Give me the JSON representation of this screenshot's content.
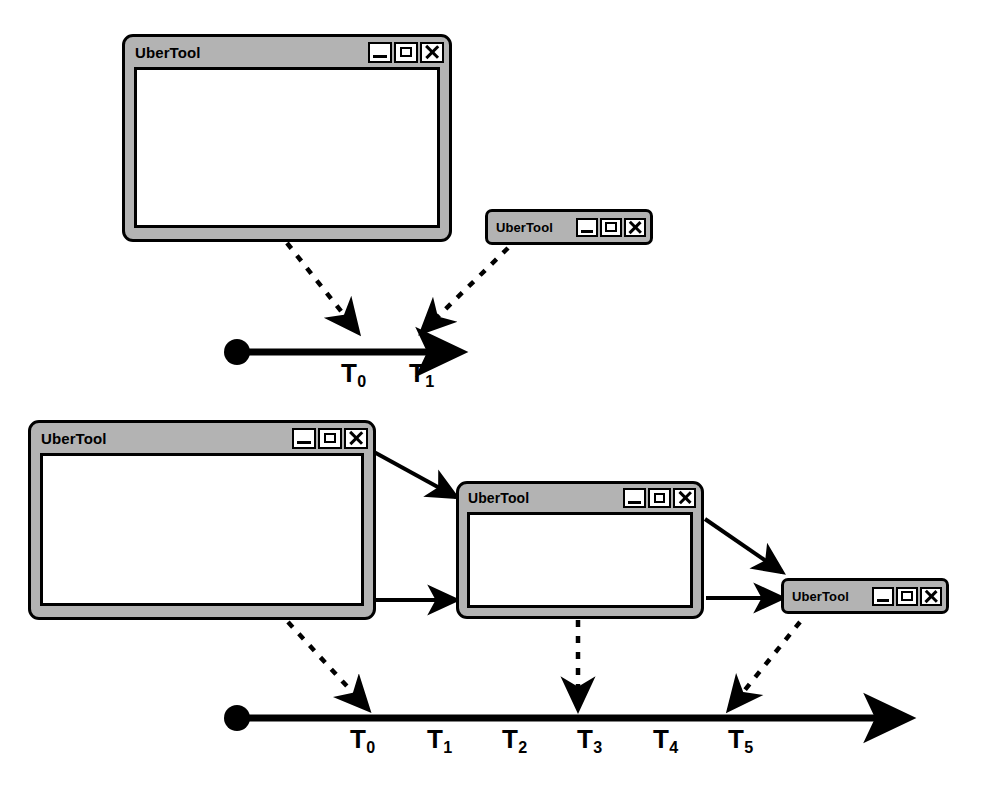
{
  "diagram": {
    "colors": {
      "window_frame": "#b3b3b3",
      "window_body": "#ffffff",
      "outline": "#000000",
      "background": "#ffffff"
    },
    "window_title": "UberTool",
    "window_buttons": [
      {
        "name": "minimize-button",
        "icon": "minimize-icon",
        "label": "_"
      },
      {
        "name": "maximize-button",
        "icon": "maximize-icon",
        "label": "□"
      },
      {
        "name": "close-button",
        "icon": "close-icon",
        "label": "✕"
      }
    ],
    "scenarios": [
      {
        "id": "scenario-1",
        "windows": [
          {
            "id": "s1-window-normal",
            "state": "normal",
            "title": "UberTool"
          },
          {
            "id": "s1-window-minimized",
            "state": "minimized",
            "title": "UberTool"
          }
        ],
        "timeline": {
          "id": "timeline-1",
          "ticks": [
            "T0",
            "T1"
          ],
          "tick_labels": [
            {
              "base": "T",
              "sub": "0"
            },
            {
              "base": "T",
              "sub": "1"
            }
          ]
        },
        "transitions": [
          {
            "from": "s1-window-normal",
            "to": "T0",
            "style": "dashed"
          },
          {
            "from": "s1-window-minimized",
            "to": "T1",
            "style": "dashed"
          }
        ]
      },
      {
        "id": "scenario-2",
        "windows": [
          {
            "id": "s2-window-large",
            "state": "normal",
            "title": "UberTool"
          },
          {
            "id": "s2-window-medium",
            "state": "normal",
            "title": "UberTool"
          },
          {
            "id": "s2-window-minimized",
            "state": "minimized",
            "title": "UberTool"
          }
        ],
        "timeline": {
          "id": "timeline-2",
          "ticks": [
            "T0",
            "T1",
            "T2",
            "T3",
            "T4",
            "T5"
          ],
          "tick_labels": [
            {
              "base": "T",
              "sub": "0"
            },
            {
              "base": "T",
              "sub": "1"
            },
            {
              "base": "T",
              "sub": "2"
            },
            {
              "base": "T",
              "sub": "3"
            },
            {
              "base": "T",
              "sub": "4"
            },
            {
              "base": "T",
              "sub": "5"
            }
          ]
        },
        "transitions": [
          {
            "from": "s2-window-large",
            "to": "s2-window-medium",
            "style": "solid"
          },
          {
            "from": "s2-window-large",
            "to": "s2-window-medium",
            "style": "solid"
          },
          {
            "from": "s2-window-medium",
            "to": "s2-window-minimized",
            "style": "solid"
          },
          {
            "from": "s2-window-medium",
            "to": "s2-window-minimized",
            "style": "solid"
          },
          {
            "from": "s2-window-large",
            "to": "T0",
            "style": "dashed"
          },
          {
            "from": "s2-window-medium",
            "to": "T3",
            "style": "dashed"
          },
          {
            "from": "s2-window-minimized",
            "to": "T5",
            "style": "dashed"
          }
        ]
      }
    ]
  }
}
